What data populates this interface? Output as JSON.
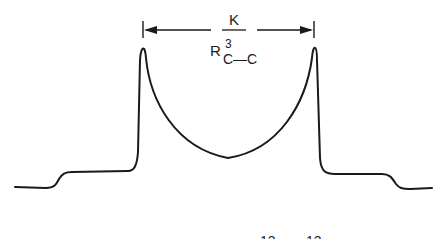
{
  "diagram": {
    "coupling_label": {
      "numerator": "K",
      "denominator_main": "R",
      "denominator_superscript": "3",
      "denominator_subscript": "C—C"
    },
    "bottom_labels": [
      "13",
      "13"
    ],
    "colors": {
      "line": "#1a1a1a",
      "background": "#ffffff"
    }
  }
}
